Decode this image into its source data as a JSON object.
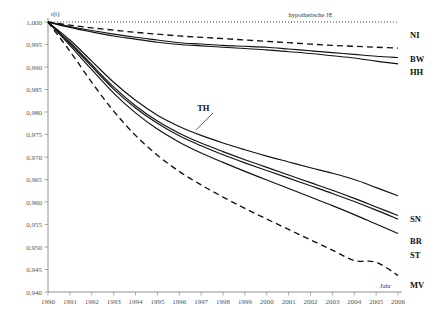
{
  "chart_data": {
    "type": "line",
    "title": "",
    "xlabel": "Jahr",
    "ylabel": "r(t)",
    "xlim": [
      1990,
      2006
    ],
    "ylim": [
      0.94,
      1.0
    ],
    "grid": false,
    "legend_position": "right-inline",
    "x": [
      1990,
      1991,
      1992,
      1993,
      1994,
      1995,
      1996,
      1997,
      1998,
      1999,
      2000,
      2001,
      2002,
      2003,
      2004,
      2005,
      2006
    ],
    "xtick_labels": [
      "1990",
      "1991",
      "1992",
      "1993",
      "1994",
      "1995",
      "1996",
      "1997",
      "1998",
      "1999",
      "2000",
      "2001",
      "2002",
      "2003",
      "2004",
      "2005",
      "2006"
    ],
    "ytick_labels": [
      "0,940",
      "0,945",
      "0,950",
      "0,955",
      "0,960",
      "0,965",
      "0,970",
      "0,975",
      "0,980",
      "0,985",
      "0,990",
      "0,995",
      "1,000"
    ],
    "ytick_values": [
      0.94,
      0.945,
      0.95,
      0.955,
      0.96,
      0.965,
      0.97,
      0.975,
      0.98,
      0.985,
      0.99,
      0.995,
      1.0
    ],
    "annotations": [
      {
        "text": "hypothetische JE",
        "x": 2002.0,
        "y": 1.0005
      },
      {
        "text": "TH",
        "x": 1997.1,
        "y": 0.9795
      }
    ],
    "series": [
      {
        "name": "hypothetische JE",
        "style": "dotted",
        "label_side": "top",
        "values": [
          1.0,
          1.0,
          1.0,
          1.0,
          1.0,
          1.0,
          1.0,
          1.0,
          1.0,
          1.0,
          1.0,
          1.0,
          1.0,
          1.0,
          1.0,
          1.0,
          1.0
        ]
      },
      {
        "name": "NI",
        "style": "dashed",
        "label_side": "right",
        "values": [
          1.0,
          0.9993,
          0.9987,
          0.9982,
          0.9977,
          0.9973,
          0.9969,
          0.9966,
          0.9963,
          0.996,
          0.9957,
          0.9954,
          0.9951,
          0.9948,
          0.9946,
          0.9944,
          0.9942
        ]
      },
      {
        "name": "BW",
        "style": "solid",
        "label_side": "right",
        "values": [
          1.0,
          0.999,
          0.9981,
          0.9973,
          0.9966,
          0.996,
          0.9954,
          0.9951,
          0.9948,
          0.9946,
          0.9944,
          0.994,
          0.9936,
          0.9932,
          0.9928,
          0.9924,
          0.9921
        ]
      },
      {
        "name": "HH",
        "style": "solid",
        "label_side": "right",
        "values": [
          1.0,
          0.9988,
          0.9978,
          0.9969,
          0.9962,
          0.9955,
          0.995,
          0.9947,
          0.9944,
          0.9941,
          0.9938,
          0.9934,
          0.993,
          0.9925,
          0.992,
          0.9913,
          0.9907
        ]
      },
      {
        "name": "SN",
        "style": "solid",
        "label_side": "right",
        "values": [
          1.0,
          0.996,
          0.9913,
          0.9866,
          0.9826,
          0.9793,
          0.9768,
          0.9748,
          0.9731,
          0.9716,
          0.9702,
          0.9689,
          0.9676,
          0.9664,
          0.965,
          0.9632,
          0.9614
        ]
      },
      {
        "name": "TH",
        "style": "solid",
        "label_side": "inline",
        "values": [
          1.0,
          0.9955,
          0.9905,
          0.9856,
          0.9814,
          0.978,
          0.9753,
          0.9731,
          0.9712,
          0.9694,
          0.9677,
          0.966,
          0.9643,
          0.9626,
          0.9608,
          0.9589,
          0.957
        ]
      },
      {
        "name": "BR",
        "style": "solid",
        "label_side": "right",
        "values": [
          1.0,
          0.9952,
          0.9901,
          0.9851,
          0.9809,
          0.9775,
          0.9747,
          0.9725,
          0.9705,
          0.9687,
          0.967,
          0.9653,
          0.9636,
          0.9619,
          0.9601,
          0.9582,
          0.9562
        ]
      },
      {
        "name": "ST",
        "style": "solid",
        "label_side": "right",
        "values": [
          1.0,
          0.9948,
          0.9894,
          0.9842,
          0.9798,
          0.9762,
          0.9733,
          0.9709,
          0.9688,
          0.9668,
          0.9649,
          0.963,
          0.9611,
          0.9592,
          0.9572,
          0.9551,
          0.953
        ]
      },
      {
        "name": "MV",
        "style": "dashed",
        "label_side": "right",
        "values": [
          1.0,
          0.9935,
          0.9866,
          0.9802,
          0.9748,
          0.9704,
          0.9668,
          0.9638,
          0.9611,
          0.9586,
          0.9562,
          0.9539,
          0.9516,
          0.9493,
          0.947,
          0.9466,
          0.9437
        ]
      }
    ]
  },
  "labels": {
    "y_axis_title": "r(t)",
    "x_axis_title": "Jahr",
    "hypothetical": "hypothetische JE",
    "th": "TH",
    "ni": "NI",
    "bw": "BW",
    "hh": "HH",
    "sn": "SN",
    "br": "BR",
    "st": "ST",
    "mv": "MV"
  }
}
